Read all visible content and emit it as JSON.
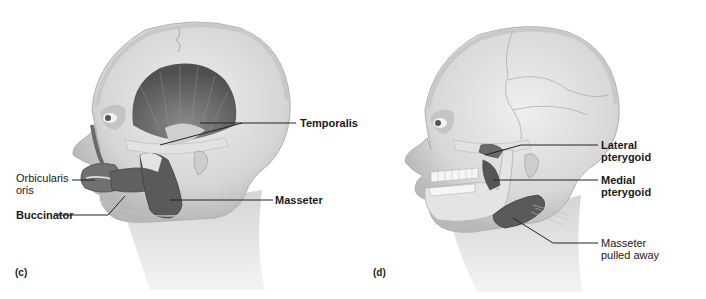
{
  "figure": {
    "panels": [
      {
        "id": "c",
        "letter": "(c)",
        "labels": {
          "orbicularis_oris_line1": "Orbicularis",
          "orbicularis_oris_line2": "oris",
          "buccinator": "Buccinator",
          "temporalis": "Temporalis",
          "masseter": "Masseter"
        }
      },
      {
        "id": "d",
        "letter": "(d)",
        "labels": {
          "lateral_pterygoid_line1": "Lateral",
          "lateral_pterygoid_line2": "pterygoid",
          "medial_pterygoid_line1": "Medial",
          "medial_pterygoid_line2": "pterygoid",
          "masseter_pulled_away_line1": "Masseter",
          "masseter_pulled_away_line2": "pulled away"
        }
      }
    ]
  },
  "colors": {
    "skin": "#dcdcdc",
    "skin_shadow": "#bdbdbd",
    "muscle": "#6e6e6e",
    "muscle_dark": "#4a4a4a",
    "tendon": "#e6e6e6",
    "leader_line": "#222222",
    "text": "#1a1a1a"
  }
}
